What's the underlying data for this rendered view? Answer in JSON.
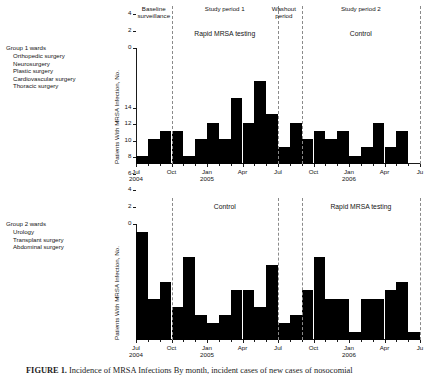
{
  "figure": {
    "caption_label": "FIGURE 1.",
    "caption_text": " Incidence of MRSA Infections By month, incident cases of new cases of nosocomial"
  },
  "axis": {
    "y_label": "Patients With MRSA Infection, No.",
    "y_ticks": [
      "0",
      "2",
      "4",
      "6",
      "8",
      "10",
      "12",
      "14"
    ],
    "y_min": 0,
    "y_max": 14,
    "x_ticks": [
      {
        "label": "Jul",
        "year": "2004",
        "index": 0
      },
      {
        "label": "Oct",
        "year": "",
        "index": 3
      },
      {
        "label": "Jan",
        "year": "2005",
        "index": 6
      },
      {
        "label": "Apr",
        "year": "",
        "index": 9
      },
      {
        "label": "Jul",
        "year": "",
        "index": 12
      },
      {
        "label": "Oct",
        "year": "",
        "index": 15
      },
      {
        "label": "Jan",
        "year": "2006",
        "index": 18
      },
      {
        "label": "Apr",
        "year": "",
        "index": 21
      },
      {
        "label": "Ju",
        "year": "",
        "index": 24
      }
    ]
  },
  "panels": [
    {
      "id": "group-1",
      "legend": {
        "title": "Group 1 wards",
        "items": [
          "Orthopedic surgery",
          "Neurosurgery",
          "Plastic surgery",
          "Cardiovascular surgery",
          "Thoracic surgery"
        ]
      },
      "phase_labels": [
        {
          "lines": [
            "Baseline",
            "surveillance"
          ],
          "index": 1.5
        },
        {
          "lines": [
            "Study period 1"
          ],
          "index": 7.5
        },
        {
          "lines": [
            "Washout",
            "period"
          ],
          "index": 12.5
        },
        {
          "lines": [
            "Study period 2"
          ],
          "index": 19.0
        }
      ],
      "arm_labels": [
        {
          "text": "Rapid MRSA testing",
          "index": 7.5
        },
        {
          "text": "Control",
          "index": 19.0
        }
      ],
      "dividers": [
        3,
        12,
        14,
        24
      ],
      "chart_data": {
        "type": "bar",
        "title": "Group 1 wards",
        "xlabel": "",
        "ylabel": "Patients With MRSA Infection, No.",
        "ylim": [
          0,
          14
        ],
        "grid": false,
        "categories": [
          "Jul 2004",
          "Aug 2004",
          "Sep 2004",
          "Oct 2004",
          "Nov 2004",
          "Dec 2004",
          "Jan 2005",
          "Feb 2005",
          "Mar 2005",
          "Apr 2005",
          "May 2005",
          "Jun 2005",
          "Jul 2005",
          "Aug 2005",
          "Sep 2005",
          "Oct 2005",
          "Nov 2005",
          "Dec 2005",
          "Jan 2006",
          "Feb 2006",
          "Mar 2006",
          "Apr 2006",
          "May 2006",
          "Jun 2006"
        ],
        "values": [
          1,
          3,
          4,
          4,
          1,
          3,
          5,
          3,
          8,
          5,
          10,
          6,
          2,
          5,
          3,
          4,
          3,
          4,
          1,
          2,
          5,
          2,
          4,
          0
        ]
      }
    },
    {
      "id": "group-2",
      "legend": {
        "title": "Group 2 wards",
        "items": [
          "Urology",
          "Transplant surgery",
          "Abdominal surgery"
        ]
      },
      "phase_labels": [],
      "arm_labels": [
        {
          "text": "Control",
          "index": 7.5
        },
        {
          "text": "Rapid MRSA testing",
          "index": 19.0
        }
      ],
      "dividers": [
        3,
        12,
        14,
        24
      ],
      "chart_data": {
        "type": "bar",
        "title": "Group 2 wards",
        "xlabel": "",
        "ylabel": "Patients With MRSA Infection, No.",
        "ylim": [
          0,
          14
        ],
        "grid": false,
        "categories": [
          "Jul 2004",
          "Aug 2004",
          "Sep 2004",
          "Oct 2004",
          "Nov 2004",
          "Dec 2004",
          "Jan 2005",
          "Feb 2005",
          "Mar 2005",
          "Apr 2005",
          "May 2005",
          "Jun 2005",
          "Jul 2005",
          "Aug 2005",
          "Sep 2005",
          "Oct 2005",
          "Nov 2005",
          "Dec 2005",
          "Jan 2006",
          "Feb 2006",
          "Mar 2006",
          "Apr 2006",
          "May 2006",
          "Jun 2006"
        ],
        "values": [
          13,
          5,
          7,
          4,
          10,
          3,
          2,
          3,
          6,
          6,
          4,
          9,
          2,
          3,
          6,
          10,
          5,
          5,
          1,
          5,
          5,
          6,
          7,
          1
        ]
      }
    }
  ]
}
